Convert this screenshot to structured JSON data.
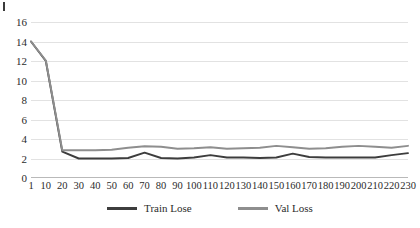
{
  "chart_data": {
    "type": "line",
    "title": "",
    "subtitle": "",
    "xlabel": "",
    "ylabel": "",
    "grid": true,
    "legend_position": "bottom",
    "ylim": [
      0,
      16
    ],
    "xlim": [
      1,
      230
    ],
    "y_ticks": [
      16,
      14,
      12,
      10,
      8,
      6,
      4,
      2,
      0
    ],
    "x_ticks": [
      1,
      10,
      20,
      30,
      40,
      50,
      60,
      70,
      80,
      90,
      100,
      110,
      120,
      130,
      140,
      150,
      160,
      170,
      180,
      190,
      200,
      210,
      220,
      230
    ],
    "x": [
      1,
      10,
      20,
      30,
      40,
      50,
      60,
      70,
      80,
      90,
      100,
      110,
      120,
      130,
      140,
      150,
      160,
      170,
      180,
      190,
      200,
      210,
      220,
      230
    ],
    "series": [
      {
        "name": "Train Lose",
        "color": "#3d3d3d",
        "values": [
          14.0,
          12.0,
          2.7,
          2.0,
          2.0,
          2.0,
          2.05,
          2.6,
          2.05,
          2.0,
          2.1,
          2.35,
          2.1,
          2.1,
          2.05,
          2.1,
          2.5,
          2.15,
          2.1,
          2.1,
          2.1,
          2.1,
          2.35,
          2.55
        ]
      },
      {
        "name": "Val Loss",
        "color": "#8e8e8e",
        "values": [
          14.0,
          12.05,
          2.85,
          2.85,
          2.85,
          2.9,
          3.1,
          3.25,
          3.2,
          3.0,
          3.05,
          3.15,
          3.0,
          3.05,
          3.1,
          3.3,
          3.15,
          3.0,
          3.05,
          3.2,
          3.3,
          3.2,
          3.1,
          3.3
        ]
      }
    ]
  },
  "legend": {
    "items": [
      {
        "label": "Train Lose",
        "color": "#3d3d3d"
      },
      {
        "label": "Val Loss",
        "color": "#8e8e8e"
      }
    ]
  },
  "colors": {
    "train": "#3d3d3d",
    "val": "#8e8e8e",
    "grid": "#e2e2e2",
    "axis": "#b9b9b9",
    "text": "#2b2b2b",
    "background": "#ffffff"
  }
}
